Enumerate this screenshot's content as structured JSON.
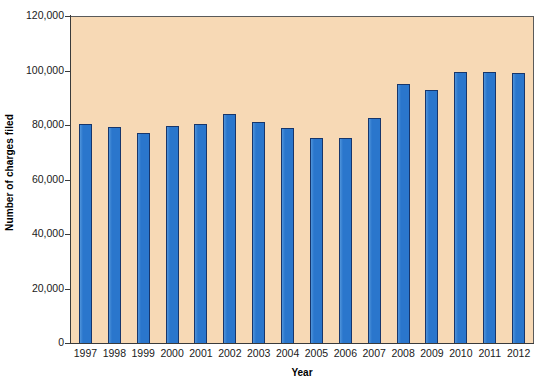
{
  "chart_data": {
    "type": "bar",
    "title": "",
    "xlabel": "Year",
    "ylabel": "Number of charges filed",
    "categories": [
      "1997",
      "1998",
      "1999",
      "2000",
      "2001",
      "2002",
      "2003",
      "2004",
      "2005",
      "2006",
      "2007",
      "2008",
      "2009",
      "2010",
      "2011",
      "2012"
    ],
    "values": [
      80680,
      79591,
      77444,
      79896,
      80840,
      84442,
      81293,
      79432,
      75428,
      75768,
      82792,
      95402,
      93277,
      99922,
      99947,
      99412
    ],
    "ylim": [
      0,
      120000
    ],
    "ytick_labels": [
      "0",
      "20,000",
      "40,000",
      "60,000",
      "80,000",
      "100,000",
      "120,000"
    ],
    "ytick_values": [
      0,
      20000,
      40000,
      60000,
      80000,
      100000,
      120000
    ],
    "grid": false,
    "legend": "none",
    "plot_background_color": "#f7d9b5",
    "bar_color": "#2a76cc",
    "bar_border_color": "#17366b",
    "axis_color": "#3a3a3a"
  }
}
